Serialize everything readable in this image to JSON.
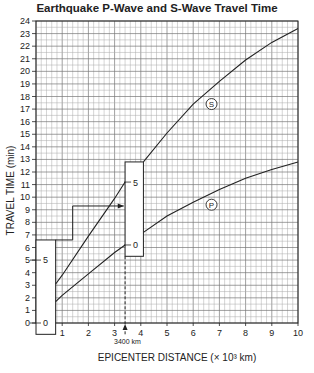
{
  "chart_data": {
    "type": "line",
    "title": "Earthquake P-Wave and S-Wave Travel Time",
    "xlabel": "EPICENTER DISTANCE (× 10³ km)",
    "ylabel": "TRAVEL TIME (min)",
    "xlim": [
      0,
      10
    ],
    "ylim": [
      0,
      24
    ],
    "x_ticks": [
      1,
      2,
      3,
      4,
      5,
      6,
      7,
      8,
      9,
      10
    ],
    "y_ticks": [
      0,
      1,
      2,
      3,
      4,
      5,
      6,
      7,
      8,
      9,
      10,
      11,
      12,
      13,
      14,
      15,
      16,
      17,
      18,
      19,
      20,
      21,
      22,
      23,
      24
    ],
    "grid": true,
    "series": [
      {
        "name": "S",
        "x": [
          0.75,
          1,
          2,
          3,
          3.4,
          4,
          5,
          6,
          7,
          8,
          9,
          10
        ],
        "values": [
          3.1,
          3.8,
          6.9,
          9.9,
          11.2,
          12.8,
          15.1,
          17.4,
          19.2,
          20.9,
          22.3,
          23.4
        ]
      },
      {
        "name": "P",
        "x": [
          0.75,
          1,
          2,
          3,
          3.4,
          4,
          5,
          6,
          7,
          8,
          9,
          10
        ],
        "values": [
          1.7,
          2.2,
          3.9,
          5.6,
          6.2,
          7.2,
          8.5,
          9.6,
          10.6,
          11.5,
          12.2,
          12.8
        ]
      }
    ],
    "annotations": [
      {
        "text": "3400 km",
        "x": 3.4,
        "type": "dashed-arrow"
      },
      {
        "text": "S",
        "x": 6.7,
        "y": 17.4,
        "type": "circle-label"
      },
      {
        "text": "P",
        "x": 6.7,
        "y": 9.4,
        "type": "circle-label"
      },
      {
        "type": "strip",
        "label_top": "5",
        "label_bottom": "0",
        "x_left": 0,
        "x_right": 0.75,
        "y_top": 6.6,
        "y_bottom": -0.9,
        "mark_5_y": 5,
        "mark_0_y": 0
      },
      {
        "type": "strip",
        "label_top": "5",
        "label_bottom": "0",
        "x_left": 3.4,
        "x_right": 4.1,
        "y_top": 12.8,
        "y_bottom": 5.3,
        "mark_5_y": 11.2,
        "mark_0_y": 6.2
      },
      {
        "type": "step-arrow",
        "points": [
          [
            0.75,
            6.6
          ],
          [
            1.4,
            6.6
          ],
          [
            1.4,
            9.3
          ],
          [
            3.35,
            9.3
          ]
        ]
      }
    ]
  },
  "labels": {
    "title": "Earthquake P-Wave and S-Wave Travel Time",
    "xlabel": "EPICENTER DISTANCE (× 10³ km)",
    "ylabel": "TRAVEL TIME (min)",
    "annotation": "3400 km"
  }
}
